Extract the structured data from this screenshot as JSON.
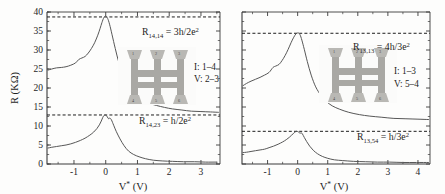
{
  "figure": {
    "panels": [
      {
        "id": "left",
        "yaxis": {
          "label": "R (KΩ)",
          "ticks": [
            "0",
            "5",
            "10",
            "15",
            "20",
            "25",
            "30",
            "35",
            "40"
          ],
          "range": [
            0,
            40
          ]
        },
        "xaxis": {
          "label": "V* (V)",
          "ticks": [
            "-1",
            "0",
            "1",
            "2",
            "3"
          ],
          "range": [
            -1.85,
            3.6
          ]
        },
        "annotations": {
          "upper_formula_base": "R",
          "upper_formula_sub": "14,14",
          "upper_formula_rest": " = 3h/2e",
          "upper_formula_sup": "2",
          "lower_formula_base": "R",
          "lower_formula_sub": "14,23",
          "lower_formula_rest": " = h/2e",
          "lower_formula_sup": "2",
          "current_leads": "I: 1–4",
          "voltage_leads": "V: 2–3"
        },
        "inset_contacts": [
          "1",
          "2",
          "3",
          "4",
          "5",
          "6"
        ]
      },
      {
        "id": "right",
        "yaxis": {
          "label": "",
          "ticks": [],
          "range": [
            0,
            40
          ]
        },
        "xaxis": {
          "label": "V* (V)",
          "ticks": [
            "-1",
            "0",
            "1",
            "2",
            "3",
            "4"
          ],
          "range": [
            -1.85,
            4.4
          ]
        },
        "annotations": {
          "upper_formula_base": "R",
          "upper_formula_sub": "13,13",
          "upper_formula_rest": " = 4h/3e",
          "upper_formula_sup": "2",
          "lower_formula_base": "R",
          "lower_formula_sub": "13,54",
          "lower_formula_rest": " = h/3e",
          "lower_formula_sup": "2",
          "current_leads": "I: 1–3",
          "voltage_leads": "V: 5–4"
        },
        "inset_contacts": [
          "1",
          "2",
          "3",
          "4",
          "5",
          "6"
        ]
      }
    ]
  },
  "chart_data": [
    {
      "type": "line",
      "panel": "left",
      "title": "",
      "xlabel": "V* (V)",
      "ylabel": "R (KΩ)",
      "xlim": [
        -1.85,
        3.6
      ],
      "ylim": [
        0,
        40
      ],
      "grid": false,
      "legend": "none",
      "xticks": [
        -1,
        0,
        1,
        2,
        3
      ],
      "yticks": [
        0,
        5,
        10,
        15,
        20,
        25,
        30,
        35,
        40
      ],
      "reference_lines": [
        {
          "name": "R_14,14 = 3h/2e^2",
          "y": 38.7,
          "style": "dashed"
        },
        {
          "name": "R_14,23 = h/2e^2",
          "y": 12.9,
          "style": "dashed"
        }
      ],
      "series": [
        {
          "name": "R_14,14",
          "x": [
            -1.82,
            -1.7,
            -1.55,
            -1.4,
            -1.25,
            -1.1,
            -0.95,
            -0.85,
            -0.75,
            -0.65,
            -0.55,
            -0.45,
            -0.35,
            -0.25,
            -0.18,
            -0.12,
            -0.06,
            0.0,
            0.06,
            0.12,
            0.2,
            0.3,
            0.42,
            0.55,
            0.7,
            0.85,
            1.0,
            1.2,
            1.4,
            1.6,
            1.85,
            2.1,
            2.4,
            2.7,
            3.0,
            3.3,
            3.55
          ],
          "y": [
            24.7,
            25.0,
            25.3,
            25.4,
            25.6,
            26.0,
            26.6,
            27.5,
            27.9,
            28.3,
            29.2,
            30.4,
            31.9,
            33.9,
            35.6,
            37.2,
            38.5,
            38.9,
            38.3,
            36.8,
            34.0,
            30.4,
            26.5,
            23.2,
            20.6,
            18.9,
            17.7,
            16.6,
            15.9,
            15.4,
            14.9,
            14.5,
            14.2,
            13.9,
            13.8,
            13.7,
            13.6
          ]
        },
        {
          "name": "R_14,23",
          "x": [
            -1.82,
            -1.7,
            -1.55,
            -1.4,
            -1.25,
            -1.1,
            -0.95,
            -0.8,
            -0.65,
            -0.5,
            -0.38,
            -0.28,
            -0.2,
            -0.14,
            -0.09,
            -0.05,
            0.0,
            0.05,
            0.09,
            0.13,
            0.18,
            0.25,
            0.33,
            0.45,
            0.58,
            0.72,
            0.88,
            1.05,
            1.25,
            1.5,
            1.8,
            2.1,
            2.45,
            2.8,
            3.15,
            3.5
          ],
          "y": [
            4.2,
            4.4,
            4.6,
            4.8,
            5.0,
            5.3,
            5.7,
            6.2,
            6.8,
            7.6,
            8.4,
            9.3,
            10.3,
            11.3,
            12.3,
            12.8,
            12.9,
            12.4,
            11.9,
            12.1,
            11.6,
            10.2,
            8.6,
            6.6,
            4.8,
            3.4,
            2.5,
            1.9,
            1.4,
            1.0,
            0.8,
            0.7,
            0.6,
            0.6,
            0.5,
            0.5
          ]
        }
      ]
    },
    {
      "type": "line",
      "panel": "right",
      "title": "",
      "xlabel": "V* (V)",
      "ylabel": "",
      "xlim": [
        -1.85,
        4.4
      ],
      "ylim": [
        0,
        40
      ],
      "grid": false,
      "legend": "none",
      "xticks": [
        -1,
        0,
        1,
        2,
        3,
        4
      ],
      "yticks": [],
      "reference_lines": [
        {
          "name": "R_13,13 = 4h/3e^2",
          "y": 34.4,
          "style": "dashed"
        },
        {
          "name": "R_13,54 = h/3e^2",
          "y": 8.6,
          "style": "dashed"
        }
      ],
      "series": [
        {
          "name": "R_13,13",
          "x": [
            -1.82,
            -1.7,
            -1.55,
            -1.4,
            -1.25,
            -1.1,
            -0.95,
            -0.82,
            -0.72,
            -0.62,
            -0.52,
            -0.42,
            -0.32,
            -0.22,
            -0.14,
            -0.06,
            0.02,
            0.08,
            0.14,
            0.22,
            0.32,
            0.45,
            0.6,
            0.78,
            0.95,
            1.15,
            1.4,
            1.7,
            2.05,
            2.4,
            2.8,
            3.2,
            3.6,
            4.0,
            4.35
          ],
          "y": [
            20.6,
            21.2,
            21.8,
            22.3,
            22.8,
            23.4,
            24.1,
            25.4,
            25.8,
            26.2,
            27.2,
            28.5,
            30.1,
            31.9,
            33.2,
            34.2,
            34.5,
            34.0,
            32.6,
            30.2,
            27.0,
            23.4,
            20.3,
            18.0,
            16.5,
            15.3,
            14.4,
            13.6,
            13.0,
            12.6,
            12.3,
            12.0,
            11.9,
            11.8,
            11.7
          ]
        },
        {
          "name": "R_13,54",
          "x": [
            -1.82,
            -1.7,
            -1.55,
            -1.4,
            -1.25,
            -1.1,
            -0.95,
            -0.8,
            -0.65,
            -0.5,
            -0.38,
            -0.28,
            -0.2,
            -0.13,
            -0.07,
            -0.02,
            0.03,
            0.08,
            0.12,
            0.16,
            0.22,
            0.3,
            0.4,
            0.52,
            0.66,
            0.82,
            1.0,
            1.22,
            1.5,
            1.85,
            2.25,
            2.65,
            3.05,
            3.5,
            3.95,
            4.35
          ],
          "y": [
            3.0,
            3.1,
            3.3,
            3.5,
            3.7,
            3.9,
            4.3,
            4.7,
            5.2,
            5.8,
            6.4,
            7.0,
            7.6,
            8.1,
            8.5,
            8.6,
            8.4,
            8.1,
            8.2,
            7.9,
            7.0,
            5.9,
            4.7,
            3.6,
            2.7,
            2.0,
            1.5,
            1.1,
            0.9,
            0.7,
            0.6,
            0.5,
            0.5,
            0.4,
            0.4,
            0.4
          ]
        }
      ]
    }
  ]
}
